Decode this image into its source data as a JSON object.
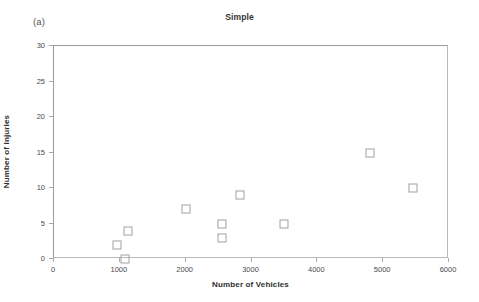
{
  "panel": {
    "letter": "(a)"
  },
  "axis_titles": {
    "x": "Number of Vehicles",
    "y": "Number of Injuries"
  },
  "chart_data": {
    "type": "scatter",
    "title": "Simple",
    "xlabel": "Number of Vehicles",
    "ylabel": "Number of Injuries",
    "xlim": [
      0,
      6000
    ],
    "ylim": [
      0,
      30
    ],
    "xticks": [
      0,
      1000,
      2000,
      3000,
      4000,
      5000,
      6000
    ],
    "yticks": [
      0,
      5,
      10,
      15,
      20,
      25,
      30
    ],
    "xtick_labels": [
      "0",
      "1000",
      "2000",
      "3000",
      "4000",
      "5000",
      "6000"
    ],
    "ytick_labels": [
      "0",
      "5",
      "10",
      "15",
      "20",
      "25",
      "30"
    ],
    "grid": false,
    "legend": null,
    "marker": "open-square",
    "marker_color": "#a0a0a0",
    "points": [
      {
        "x": 950,
        "y": 2
      },
      {
        "x": 1080,
        "y": 0
      },
      {
        "x": 1120,
        "y": 4
      },
      {
        "x": 2000,
        "y": 7
      },
      {
        "x": 2550,
        "y": 5
      },
      {
        "x": 2550,
        "y": 3
      },
      {
        "x": 2820,
        "y": 9
      },
      {
        "x": 3500,
        "y": 5
      },
      {
        "x": 4800,
        "y": 15
      },
      {
        "x": 5450,
        "y": 10
      }
    ]
  }
}
